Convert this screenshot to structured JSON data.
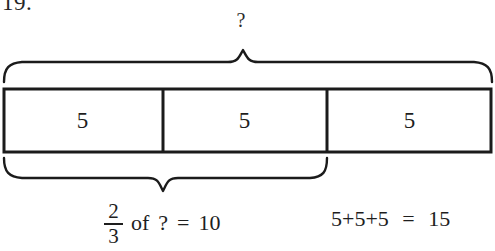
{
  "worksheet": {
    "problem_number": "19.",
    "background_color": "#ffffff",
    "ink_color": "#1b1b1b"
  },
  "diagram": {
    "top_brace": {
      "label": "?",
      "spans_segments": 3,
      "name": "whole-brace"
    },
    "bar_model": {
      "segments": [
        {
          "value": "5"
        },
        {
          "value": "5"
        },
        {
          "value": "5"
        }
      ]
    },
    "bottom_brace": {
      "spans_segments": 2,
      "name": "part-brace"
    }
  },
  "equations": {
    "fraction_statement": {
      "numerator": "2",
      "denominator": "3",
      "of_word": "of",
      "unknown": "?",
      "equals": "=",
      "result": "10"
    },
    "sum_statement": {
      "addition": "5+5+5",
      "equals": "=",
      "total": "15"
    }
  }
}
